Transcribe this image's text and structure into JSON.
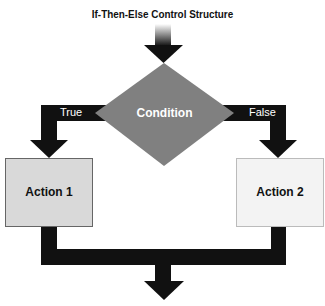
{
  "title": "If-Then-Else Control Structure",
  "nodes": {
    "condition": {
      "label": "Condition",
      "shape": "diamond",
      "fill": "#808080"
    },
    "action1": {
      "label": "Action 1",
      "shape": "rectangle",
      "fill": "#d9d9d9"
    },
    "action2": {
      "label": "Action 2",
      "shape": "rectangle",
      "fill": "#f3f3f3"
    }
  },
  "edges": {
    "true_label": "True",
    "false_label": "False",
    "color": "#111111"
  }
}
